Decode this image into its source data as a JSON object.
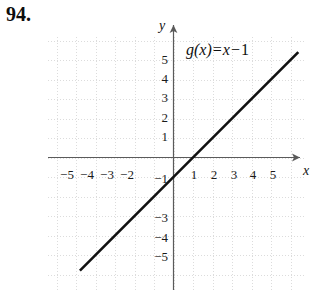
{
  "problem": {
    "number": "94."
  },
  "chart_data": {
    "type": "line",
    "title": "",
    "equation_label": {
      "function_name": "g",
      "argument": "(x)",
      "equals": "=",
      "variable": "x",
      "minus": "−",
      "constant": "1",
      "full_text": "g(x) = x − 1"
    },
    "expression": "g(x) = x - 1",
    "slope": 1,
    "y_intercept": -1,
    "x_intercept": 1,
    "series": [
      {
        "name": "g(x) = x − 1",
        "points": [
          {
            "x": -4.8,
            "y": -5.8
          },
          {
            "x": 6.4,
            "y": 5.4
          }
        ],
        "color": "#111111"
      }
    ],
    "xlabel": "x",
    "ylabel": "y",
    "xlim": [
      -6.4,
      6.8
    ],
    "ylim": [
      -6.2,
      6.8
    ],
    "grid": true,
    "grid_style": "dotted",
    "grid_color": "#dcdcdc",
    "legend": "none",
    "axis_color": "#555555",
    "x_ticks": [
      {
        "value": -5,
        "label": "−5"
      },
      {
        "value": -4,
        "label": "−4"
      },
      {
        "value": -3,
        "label": "−3"
      },
      {
        "value": -2,
        "label": "−2"
      },
      {
        "value": 1,
        "label": "1"
      },
      {
        "value": 2,
        "label": "2"
      },
      {
        "value": 3,
        "label": "3"
      },
      {
        "value": 4,
        "label": "4"
      },
      {
        "value": 5,
        "label": "5"
      }
    ],
    "y_ticks": [
      {
        "value": 5,
        "label": "5"
      },
      {
        "value": 4,
        "label": "4"
      },
      {
        "value": 3,
        "label": "3"
      },
      {
        "value": 2,
        "label": "2"
      },
      {
        "value": 1,
        "label": "1"
      },
      {
        "value": -1,
        "label": "−1"
      },
      {
        "value": -3,
        "label": "−3"
      },
      {
        "value": -4,
        "label": "−4"
      },
      {
        "value": -5,
        "label": "−5"
      }
    ]
  }
}
